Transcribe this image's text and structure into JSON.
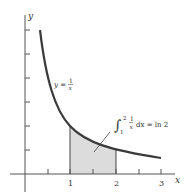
{
  "figure": {
    "type": "function-area-diagram",
    "function_label": {
      "lhs": "y =",
      "num": "1",
      "den": "x"
    },
    "integral_label": {
      "upper": "2",
      "lower": "1",
      "num": "1",
      "den": "x",
      "rest": "dx = ln 2"
    },
    "axes": {
      "x_label": "x",
      "y_label": "y",
      "x_ticks": [
        "1",
        "2",
        "3"
      ]
    },
    "shaded_region": {
      "from": 1,
      "to": 2
    },
    "colors": {
      "curve": "#3a3a3a",
      "shade": "#dcdcdc",
      "axis": "#555555"
    }
  }
}
